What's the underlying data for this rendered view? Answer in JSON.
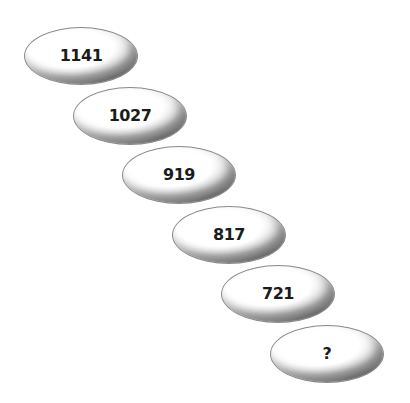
{
  "puzzle": {
    "type": "number-sequence",
    "items": [
      {
        "label": "1141"
      },
      {
        "label": "1027"
      },
      {
        "label": "919"
      },
      {
        "label": "817"
      },
      {
        "label": "721"
      },
      {
        "label": "?"
      }
    ]
  }
}
